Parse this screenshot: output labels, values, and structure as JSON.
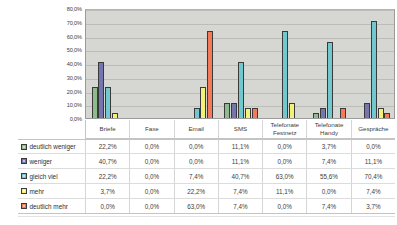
{
  "chart_data": {
    "type": "bar",
    "title": "",
    "xlabel": "",
    "ylabel": "",
    "ylim": [
      0,
      80
    ],
    "grid": true,
    "legend_position": "table-left",
    "value_suffix": "%",
    "decimal_separator": ",",
    "categories": [
      "Briefe",
      "Faxe",
      "Email",
      "SMS",
      "Telefonate Festnetz",
      "Telefonate Handy",
      "Gespräche"
    ],
    "ytick_labels": [
      "80,0%",
      "70,0%",
      "60,0%",
      "50,0%",
      "40,0%",
      "30,0%",
      "20,0%",
      "10,0%",
      "0,0%"
    ],
    "ytick_values": [
      80,
      70,
      60,
      50,
      40,
      30,
      20,
      10,
      0
    ],
    "series": [
      {
        "name": "deutlich weniger",
        "color": "#8FBC8C",
        "values": [
          22.2,
          0.0,
          0.0,
          11.1,
          0.0,
          3.7,
          0.0
        ],
        "labels": [
          "22,2%",
          "0,0%",
          "0,0%",
          "11,1%",
          "0,0%",
          "3,7%",
          "0,0%"
        ]
      },
      {
        "name": "weniger",
        "color": "#7575B0",
        "values": [
          40.7,
          0.0,
          0.0,
          11.1,
          0.0,
          7.4,
          11.1
        ],
        "labels": [
          "40,7%",
          "0,0%",
          "0,0%",
          "11,1%",
          "0,0%",
          "7,4%",
          "11,1%"
        ]
      },
      {
        "name": "gleich viel",
        "color": "#71C8CE",
        "values": [
          22.2,
          0.0,
          7.4,
          40.7,
          63.0,
          55.6,
          70.4
        ],
        "labels": [
          "22,2%",
          "0,0%",
          "7,4%",
          "40,7%",
          "63,0%",
          "55,6%",
          "70,4%"
        ]
      },
      {
        "name": "mehr",
        "color": "#F2F279",
        "values": [
          3.7,
          0.0,
          22.2,
          7.4,
          11.1,
          0.0,
          7.4
        ],
        "labels": [
          "3,7%",
          "0,0%",
          "22,2%",
          "7,4%",
          "11,1%",
          "0,0%",
          "7,4%"
        ]
      },
      {
        "name": "deutlich mehr",
        "color": "#F47A58",
        "values": [
          0.0,
          0.0,
          63.0,
          7.4,
          0.0,
          7.4,
          3.7
        ],
        "labels": [
          "0,0%",
          "0,0%",
          "63,0%",
          "7,4%",
          "0,0%",
          "7,4%",
          "3,7%"
        ]
      }
    ]
  },
  "colors": {
    "plot_background": "#d6d6d2",
    "gridline": "#bdbdb8",
    "axis_border": "#9a9a9a",
    "table_rule": "#dcdcdc",
    "text": "#3d3d3d"
  }
}
